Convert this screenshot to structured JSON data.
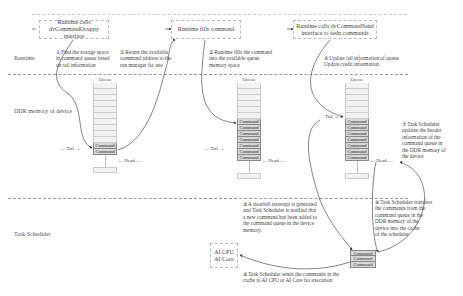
{
  "lanes": {
    "runtime": "Runtime",
    "ddr": "DDR memory of device",
    "scheduler": "Task Scheduler"
  },
  "top_boxes": [
    {
      "text": "Runtime calls\ndvCommandOcuppy interface"
    },
    {
      "text": "Runtime fills command"
    },
    {
      "text": "Runtime calls dvCommandSend\ninterface to sedn commands"
    }
  ],
  "steps": {
    "s1": "① Find the storage space\nin command queue based\non tail information",
    "s2": "② Return the available\ncommand address to the\nrun manager for use",
    "s3": "③ Runtime fills the command\ninto the available queue\nmemory space",
    "s4": "④ Update tail information of queue\nUpdate credit information",
    "s5": "⑤ A doorbell interrupt is generated\nand Task Scheduler is notified that\na new command has been added to\nthe command queue in the device\nmemory.",
    "s6": "⑥ Task Scheduler transfers\nthe commands from the\ncommand queue in the\nDDR memory of the\ndevice into the cache\nof the scheduler",
    "s7": "⑦ Task Scheduler\nupdates the header\ninformation of the\ncommand queue in\nthe DDR memory of\nthe device",
    "s8": "⑧ Task Scheduler sends the commands in the\ncache to AI CPU or AI Core for execution"
  },
  "queues": [
    {
      "title": "Queue",
      "empty_slots": 10,
      "commands": [
        "Command",
        "Command"
      ],
      "tail_label": "Tail",
      "head_label": "Head"
    },
    {
      "title": "Queue",
      "empty_slots": 6,
      "commands": [
        "Command",
        "Command",
        "Command",
        "Command",
        "Command",
        "Command",
        "Command"
      ],
      "tail_label": "Tail",
      "head_label": "Head"
    },
    {
      "title": "Queue",
      "empty_slots": 6,
      "commands": [
        "Command",
        "Command",
        "Command",
        "Command",
        "Command",
        "Command",
        "Command"
      ],
      "tail_label": "Tail",
      "head_label": "Head"
    }
  ],
  "scheduler_cache": [
    "Command",
    "Command",
    "Command"
  ],
  "ai_box": {
    "line1": "AI CPU",
    "line2": "AI Core"
  }
}
